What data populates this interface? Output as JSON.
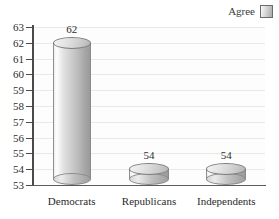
{
  "legend": {
    "label": "Agree",
    "swatch_icon": "gradient-square-swatch",
    "position": "top-right"
  },
  "chart_data": {
    "type": "bar",
    "title": "",
    "xlabel": "",
    "ylabel": "",
    "categories": [
      "Democrats",
      "Republicans",
      "Independents"
    ],
    "values": [
      62,
      54,
      54
    ],
    "value_labels": [
      "62",
      "54",
      "54"
    ],
    "series": [
      {
        "name": "Agree",
        "values": [
          62,
          54,
          54
        ]
      }
    ],
    "ylim": [
      53,
      63
    ],
    "ytick_labels": [
      "63",
      "62",
      "61",
      "60",
      "59",
      "58",
      "57",
      "56",
      "55",
      "54",
      "53"
    ],
    "ytick_values": [
      63,
      62,
      61,
      60,
      59,
      58,
      57,
      56,
      55,
      54,
      53
    ],
    "grid": true,
    "legend_position": "top-right",
    "style": "3d-cylinder-grayscale"
  },
  "colors": {
    "axis": "#4a4a4a",
    "gridline": "#e9e9e9",
    "plot_background": "#fdfdfd",
    "cylinder_light": "#fdfdfd",
    "cylinder_dark": "#9a9a9a",
    "text": "#2e2e2e"
  }
}
